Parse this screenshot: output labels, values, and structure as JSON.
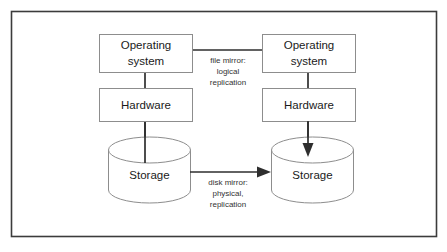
{
  "diagram": {
    "frame": {
      "border_color": "#3c3c3c",
      "background": "#ffffff"
    },
    "left_stack": {
      "os_box_label_line1": "Operating",
      "os_box_label_line2": "system",
      "hardware_box_label": "Hardware",
      "storage_label": "Storage"
    },
    "right_stack": {
      "os_box_label_line1": "Operating",
      "os_box_label_line2": "system",
      "hardware_box_label": "Hardware",
      "storage_label": "Storage"
    },
    "annotations": {
      "file_mirror": {
        "line1": "file mirror:",
        "line2": "logical",
        "line3": "replication"
      },
      "disk_mirror": {
        "line1": "disk mirror:",
        "line2": "physical,",
        "line3": "replication"
      }
    },
    "colors": {
      "box_stroke": "#8d8d8d",
      "connector_stroke": "#2e2e2e",
      "text": "#1a1a1a"
    },
    "icons": {
      "cylinder": "database-cylinder-icon",
      "arrow": "arrow-icon"
    }
  }
}
